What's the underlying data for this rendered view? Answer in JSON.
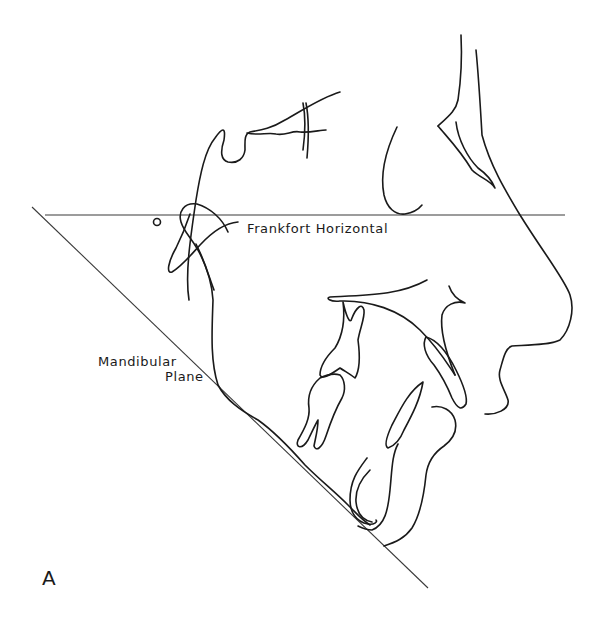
{
  "figure": {
    "panel_label": "A",
    "type": "cephalometric tracing (lateral skull profile)",
    "labels": {
      "frankfort_horizontal": "Frankfort Horizontal",
      "mandibular_plane_line1": "Mandibular",
      "mandibular_plane_line2": "Plane"
    },
    "reference_lines": [
      {
        "name": "Frankfort Horizontal",
        "from": [
          45,
          215
        ],
        "to": [
          565,
          215
        ]
      },
      {
        "name": "Mandibular Plane",
        "from": [
          32,
          207
        ],
        "to": [
          428,
          588
        ]
      }
    ],
    "colors": {
      "line": "#1a1a1a",
      "background": "#ffffff"
    }
  }
}
